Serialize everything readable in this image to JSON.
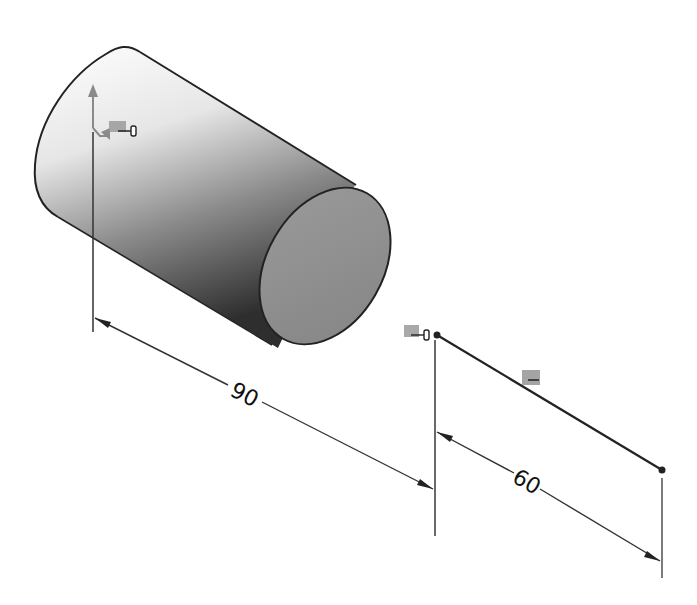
{
  "drawing": {
    "type": "CAD sketch - cylinder with linear dimension",
    "background": "#ffffff",
    "cylinder": {
      "body_shade_light": "#f4f4f4",
      "body_shade_dark": "#2a2a2a",
      "end_face_color": "#8e8e8e",
      "outline_color": "#222222"
    },
    "origin_marker": {
      "axis_color": "#8a8a8a",
      "relation_icon": "coincident-relation-icon"
    },
    "dimensions": [
      {
        "id": "dim-90",
        "value": "90",
        "label": "90"
      },
      {
        "id": "dim-60",
        "value": "60",
        "label": "60"
      }
    ],
    "sketch_line": {
      "relation_icons": [
        "coincident-relation-icon",
        "horizontal-relation-icon"
      ],
      "endpoint_color": "#222222"
    }
  }
}
